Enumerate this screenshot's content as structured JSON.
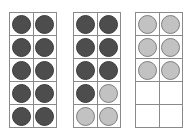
{
  "figure": {
    "kind": "ten-frame-counter-set",
    "background_color": "#ffffff",
    "grid_line_color": "#8a8a8a",
    "counter_colors": {
      "dark": "#4d4d4d",
      "dark_outline": "#3a3a3a",
      "light": "#c2c2c2",
      "light_outline": "#7e7e7e"
    },
    "rows": 5,
    "columns": 2,
    "frames": [
      {
        "name": "ten-frame-1",
        "dark_count": 10,
        "light_count": 0,
        "empty_count": 0,
        "cells": [
          [
            "dark",
            "dark"
          ],
          [
            "dark",
            "dark"
          ],
          [
            "dark",
            "dark"
          ],
          [
            "dark",
            "dark"
          ],
          [
            "dark",
            "dark"
          ]
        ]
      },
      {
        "name": "ten-frame-2",
        "dark_count": 7,
        "light_count": 3,
        "empty_count": 0,
        "cells": [
          [
            "dark",
            "dark"
          ],
          [
            "dark",
            "dark"
          ],
          [
            "dark",
            "dark"
          ],
          [
            "dark",
            "light"
          ],
          [
            "light",
            "light"
          ]
        ]
      },
      {
        "name": "ten-frame-3",
        "dark_count": 0,
        "light_count": 6,
        "empty_count": 4,
        "cells": [
          [
            "light",
            "light"
          ],
          [
            "light",
            "light"
          ],
          [
            "light",
            "light"
          ],
          [
            "empty",
            "empty"
          ],
          [
            "empty",
            "empty"
          ]
        ]
      }
    ]
  }
}
